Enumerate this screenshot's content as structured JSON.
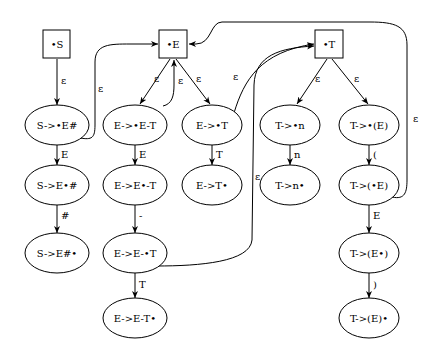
{
  "diagram": {
    "type": "epsilon-NFA of LR(0) items",
    "nodes": [
      {
        "id": "S",
        "label": "•S",
        "shape": "box",
        "cx": 57,
        "cy": 44
      },
      {
        "id": "E",
        "label": "•E",
        "shape": "box",
        "cx": 173,
        "cy": 44
      },
      {
        "id": "T",
        "label": "•T",
        "shape": "box",
        "cx": 329,
        "cy": 44
      },
      {
        "id": "n1",
        "label": "S->•E#",
        "shape": "ellipse",
        "cx": 57,
        "cy": 125
      },
      {
        "id": "n2",
        "label": "S->E•#",
        "shape": "ellipse",
        "cx": 57,
        "cy": 185
      },
      {
        "id": "n3",
        "label": "S->E#•",
        "shape": "ellipse",
        "cx": 57,
        "cy": 253
      },
      {
        "id": "n4",
        "label": "E->•E-T",
        "shape": "ellipse",
        "cx": 135,
        "cy": 125
      },
      {
        "id": "n5",
        "label": "E->E•-T",
        "shape": "ellipse",
        "cx": 135,
        "cy": 185
      },
      {
        "id": "n6",
        "label": "E->E-•T",
        "shape": "ellipse",
        "cx": 135,
        "cy": 253
      },
      {
        "id": "n7",
        "label": "E->E-T•",
        "shape": "ellipse",
        "cx": 135,
        "cy": 318
      },
      {
        "id": "n8",
        "label": "E->•T",
        "shape": "ellipse",
        "cx": 212,
        "cy": 125
      },
      {
        "id": "n9",
        "label": "E->T•",
        "shape": "ellipse",
        "cx": 212,
        "cy": 185
      },
      {
        "id": "n10",
        "label": "T->•n",
        "shape": "ellipse",
        "cx": 290,
        "cy": 125
      },
      {
        "id": "n11",
        "label": "T->n•",
        "shape": "ellipse",
        "cx": 290,
        "cy": 185
      },
      {
        "id": "n12",
        "label": "T->•(E)",
        "shape": "ellipse",
        "cx": 369,
        "cy": 125
      },
      {
        "id": "n13",
        "label": "T->(•E)",
        "shape": "ellipse",
        "cx": 369,
        "cy": 185
      },
      {
        "id": "n14",
        "label": "T->(E•)",
        "shape": "ellipse",
        "cx": 369,
        "cy": 253
      },
      {
        "id": "n15",
        "label": "T->(E)•",
        "shape": "ellipse",
        "cx": 369,
        "cy": 318
      }
    ],
    "edges": [
      {
        "from": "S",
        "to": "n1",
        "label": "ε"
      },
      {
        "from": "n1",
        "to": "n2",
        "label": "E"
      },
      {
        "from": "n2",
        "to": "n3",
        "label": "#"
      },
      {
        "from": "n1",
        "to": "E",
        "label": "ε"
      },
      {
        "from": "E",
        "to": "n4",
        "label": "ε"
      },
      {
        "from": "n4",
        "to": "E",
        "label": "ε"
      },
      {
        "from": "E",
        "to": "n8",
        "label": "ε"
      },
      {
        "from": "n4",
        "to": "n5",
        "label": "E"
      },
      {
        "from": "n5",
        "to": "n6",
        "label": "-"
      },
      {
        "from": "n6",
        "to": "n7",
        "label": "T"
      },
      {
        "from": "n6",
        "to": "T",
        "label": "ε"
      },
      {
        "from": "n8",
        "to": "n9",
        "label": "T"
      },
      {
        "from": "n8",
        "to": "T",
        "label": "ε"
      },
      {
        "from": "T",
        "to": "n10",
        "label": "ε"
      },
      {
        "from": "T",
        "to": "n12",
        "label": "ε"
      },
      {
        "from": "n10",
        "to": "n11",
        "label": "n"
      },
      {
        "from": "n12",
        "to": "n13",
        "label": "("
      },
      {
        "from": "n13",
        "to": "n14",
        "label": "E"
      },
      {
        "from": "n14",
        "to": "n15",
        "label": ")"
      },
      {
        "from": "n13",
        "to": "E",
        "label": "ε"
      }
    ]
  }
}
